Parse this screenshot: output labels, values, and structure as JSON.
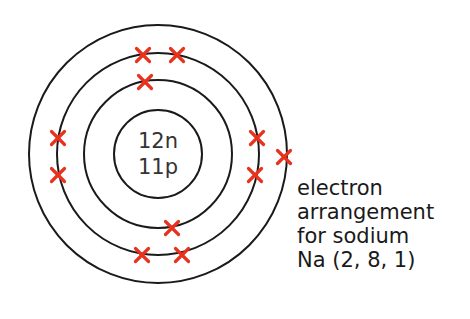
{
  "nucleus": {
    "neutrons_label": "12n",
    "protons_label": "11p"
  },
  "shells": [
    {
      "name": "shell-1",
      "electrons": 2
    },
    {
      "name": "shell-2",
      "electrons": 8
    },
    {
      "name": "shell-3",
      "electrons": 1
    }
  ],
  "electron_symbol": "×",
  "colors": {
    "electron": "#e8321e",
    "line": "#1a1a1a",
    "text": "#1a1a1a",
    "nucleus_text": "#333333"
  },
  "caption": {
    "line1": "electron",
    "line2": "arrangement",
    "line3": "for sodium",
    "line4": "Na (2, 8, 1)"
  }
}
